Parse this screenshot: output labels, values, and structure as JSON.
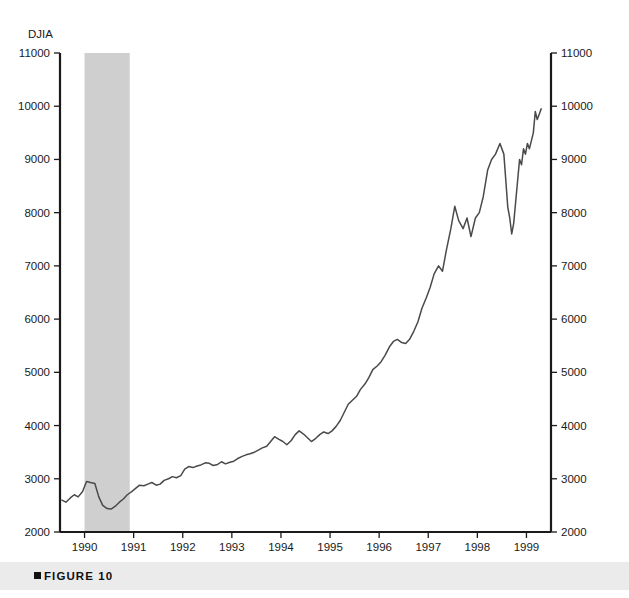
{
  "figure": {
    "caption_label": "FIGURE 10",
    "caption_marker_name": "square-bullet-icon",
    "caption_band_color": "#ebebeb"
  },
  "chart_data": {
    "type": "line",
    "title": "",
    "series_label": "DJIA",
    "xlabel": "",
    "ylabel": "DJIA",
    "ylim": [
      2000,
      11000
    ],
    "xlim": [
      1989.5,
      1999.5
    ],
    "grid": false,
    "legend": "none",
    "line_color": "#4a4a4a",
    "y_ticks": [
      2000,
      3000,
      4000,
      5000,
      6000,
      7000,
      8000,
      9000,
      10000,
      11000
    ],
    "y_tick_labels_left": [
      "2000",
      "3000",
      "4000",
      "5000",
      "6000",
      "7000",
      "8000",
      "9000",
      "10000",
      "11000"
    ],
    "y_tick_labels_right": [
      "2000",
      "3000",
      "4000",
      "5000",
      "6000",
      "7000",
      "8000",
      "9000",
      "10000",
      "11000"
    ],
    "x_ticks": [
      1990,
      1991,
      1992,
      1993,
      1994,
      1995,
      1996,
      1997,
      1998,
      1999
    ],
    "x_tick_labels": [
      "1990",
      "1991",
      "1992",
      "1993",
      "1994",
      "1995",
      "1996",
      "1997",
      "1998",
      "1999"
    ],
    "annotations": [
      {
        "type": "shaded-band",
        "name": "recession-band",
        "label": "recession",
        "x_start": 1990.0,
        "x_end": 1990.92,
        "color": "#cfcfcf"
      }
    ],
    "x": [
      1989.54,
      1989.62,
      1989.71,
      1989.79,
      1989.87,
      1989.96,
      1990.04,
      1990.12,
      1990.21,
      1990.29,
      1990.37,
      1990.46,
      1990.54,
      1990.62,
      1990.71,
      1990.79,
      1990.87,
      1990.96,
      1991.04,
      1991.12,
      1991.21,
      1991.29,
      1991.37,
      1991.46,
      1991.54,
      1991.62,
      1991.71,
      1991.79,
      1991.87,
      1991.96,
      1992.04,
      1992.12,
      1992.21,
      1992.29,
      1992.37,
      1992.46,
      1992.54,
      1992.62,
      1992.71,
      1992.79,
      1992.87,
      1992.96,
      1993.04,
      1993.12,
      1993.21,
      1993.29,
      1993.37,
      1993.46,
      1993.54,
      1993.62,
      1993.71,
      1993.79,
      1993.87,
      1993.96,
      1994.04,
      1994.12,
      1994.21,
      1994.29,
      1994.37,
      1994.46,
      1994.54,
      1994.62,
      1994.71,
      1994.79,
      1994.87,
      1994.96,
      1995.04,
      1995.12,
      1995.21,
      1995.29,
      1995.37,
      1995.46,
      1995.54,
      1995.62,
      1995.71,
      1995.79,
      1995.87,
      1995.96,
      1996.04,
      1996.12,
      1996.21,
      1996.29,
      1996.37,
      1996.46,
      1996.54,
      1996.62,
      1996.71,
      1996.79,
      1996.87,
      1996.96,
      1997.04,
      1997.12,
      1997.21,
      1997.29,
      1997.37,
      1997.46,
      1997.54,
      1997.62,
      1997.71,
      1997.79,
      1997.87,
      1997.96,
      1998.04,
      1998.12,
      1998.21,
      1998.29,
      1998.37,
      1998.46,
      1998.54,
      1998.58,
      1998.62,
      1998.66,
      1998.7,
      1998.74,
      1998.78,
      1998.82,
      1998.86,
      1998.9,
      1998.94,
      1998.98,
      1999.02,
      1999.06,
      1999.1,
      1999.14,
      1999.18,
      1999.22,
      1999.26,
      1999.3
    ],
    "y": [
      2600,
      2560,
      2640,
      2700,
      2660,
      2760,
      2950,
      2930,
      2910,
      2660,
      2500,
      2440,
      2430,
      2480,
      2560,
      2620,
      2700,
      2760,
      2820,
      2880,
      2870,
      2900,
      2930,
      2880,
      2900,
      2970,
      3000,
      3040,
      3020,
      3060,
      3180,
      3230,
      3210,
      3240,
      3260,
      3300,
      3290,
      3250,
      3270,
      3320,
      3280,
      3310,
      3330,
      3380,
      3420,
      3450,
      3470,
      3500,
      3540,
      3580,
      3610,
      3700,
      3790,
      3740,
      3700,
      3640,
      3720,
      3830,
      3900,
      3840,
      3770,
      3700,
      3760,
      3830,
      3880,
      3850,
      3900,
      3980,
      4100,
      4250,
      4400,
      4480,
      4550,
      4680,
      4780,
      4900,
      5050,
      5120,
      5200,
      5320,
      5480,
      5580,
      5620,
      5560,
      5540,
      5620,
      5780,
      5950,
      6200,
      6400,
      6600,
      6850,
      7000,
      6900,
      7300,
      7700,
      8120,
      7850,
      7700,
      7900,
      7550,
      7900,
      8000,
      8300,
      8800,
      9000,
      9100,
      9300,
      9100,
      8600,
      8100,
      7900,
      7600,
      7800,
      8200,
      8600,
      9000,
      8900,
      9200,
      9100,
      9300,
      9200,
      9350,
      9500,
      9900,
      9750,
      9850,
      9950
    ]
  }
}
